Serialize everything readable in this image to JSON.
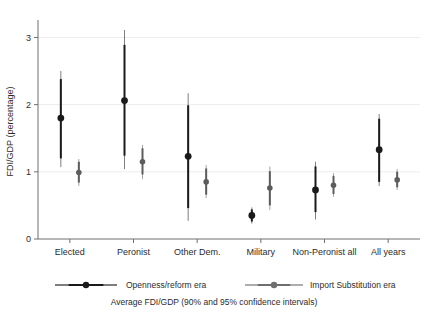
{
  "chart_data": {
    "type": "scatter",
    "title": "",
    "subtitle": "",
    "xlabel": "Average FDI/GDP (90% and 95% confidence intervals)",
    "ylabel": "FDI/GDP (percentage)",
    "ylim": [
      0,
      3.2
    ],
    "yticks": [
      0,
      1,
      2,
      3
    ],
    "ytick_labels": [
      "0",
      "1",
      "2",
      "3"
    ],
    "grid": true,
    "grid_axis": "y",
    "legend_position": "bottom",
    "categories": [
      "Elected",
      "Peronist",
      "Other Dem.",
      "Military",
      "Non-Peronist all",
      "All years"
    ],
    "series": [
      {
        "name": "Openness/reform era",
        "color": "#1a1a1a",
        "marker": "filled-circle",
        "values": [
          1.8,
          2.06,
          1.23,
          0.35,
          0.73,
          1.33
        ],
        "ci90_low": [
          1.2,
          1.24,
          0.46,
          0.26,
          0.4,
          0.85
        ],
        "ci90_high": [
          2.38,
          2.89,
          1.99,
          0.44,
          1.08,
          1.79
        ],
        "ci95_low": [
          1.07,
          1.04,
          0.27,
          0.23,
          0.29,
          0.79
        ],
        "ci95_high": [
          2.5,
          3.11,
          2.17,
          0.47,
          1.15,
          1.86
        ]
      },
      {
        "name": "Import Substitution era",
        "color": "#5c5c5c",
        "marker": "filled-circle",
        "values": [
          0.99,
          1.15,
          0.85,
          0.76,
          0.8,
          0.88
        ],
        "ci90_low": [
          0.84,
          0.96,
          0.66,
          0.5,
          0.67,
          0.77
        ],
        "ci90_high": [
          1.15,
          1.35,
          1.05,
          1.01,
          0.94,
          1.0
        ],
        "ci95_low": [
          0.79,
          0.89,
          0.61,
          0.43,
          0.63,
          0.73
        ],
        "ci95_high": [
          1.19,
          1.4,
          1.1,
          1.08,
          0.98,
          1.04
        ]
      }
    ]
  },
  "legend": {
    "entries": [
      {
        "label": "Openness/reform era",
        "color": "#1a1a1a"
      },
      {
        "label": "Import Substitution era",
        "color": "#6e6e6e"
      }
    ]
  },
  "caption": "Average FDI/GDP (90% and 95% confidence intervals)",
  "axis": {
    "y_title": "FDI/GDP (percentage)"
  }
}
